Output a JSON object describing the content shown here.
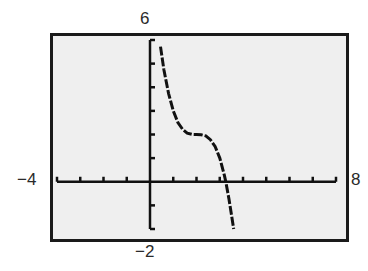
{
  "chart_data": {
    "type": "line",
    "title": "",
    "xlabel": "",
    "ylabel": "",
    "xlim": [
      -4,
      8
    ],
    "ylim": [
      -2,
      6
    ],
    "xscale_tick": 1,
    "yscale_tick": 1,
    "grid": false,
    "window_labels": {
      "ymax": "6",
      "ymin": "−2",
      "xmin": "−4",
      "xmax": "8"
    },
    "series": [
      {
        "name": "f(x)",
        "description": "Decreasing cubic with horizontal inflection plateau near (2, 2); crosses x-axis near x ≈ 3.26",
        "x": [
          0.45,
          0.6,
          0.8,
          1.0,
          1.2,
          1.4,
          1.6,
          1.8,
          2.0,
          2.2,
          2.4,
          2.6,
          2.8,
          3.0,
          3.2,
          3.26,
          3.4,
          3.6
        ],
        "values": [
          5.72,
          4.74,
          3.73,
          3.0,
          2.51,
          2.22,
          2.06,
          2.01,
          2.0,
          1.99,
          1.94,
          1.78,
          1.49,
          1.0,
          0.27,
          0.0,
          -0.74,
          -2.0
        ]
      }
    ],
    "colors": {
      "screen_bg": "#efefef",
      "frame": "#1a1a1a",
      "curve": "#111111",
      "axes": "#111111"
    }
  }
}
